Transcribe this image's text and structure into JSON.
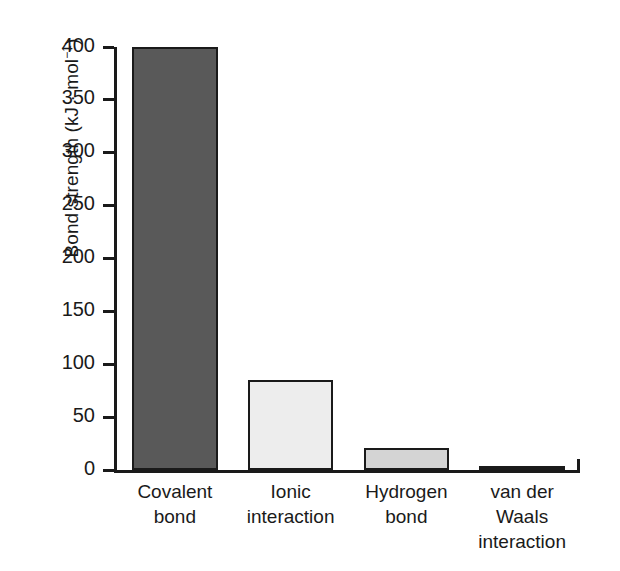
{
  "chart_data": {
    "type": "bar",
    "title": "",
    "xlabel": "",
    "ylabel": "Bond strength (kJ · mol⁻¹)",
    "ylabel_text": "Bond strength (kJ · mol",
    "ylabel_sup": "−1",
    "ylabel_tail": ")",
    "categories": [
      "Covalent bond",
      "Ionic interaction",
      "Hydrogen bond",
      "van der Waals interaction"
    ],
    "category_lines": [
      "Covalent\nbond",
      "Ionic\ninteraction",
      "Hydrogen\nbond",
      "van der\nWaals\ninteraction"
    ],
    "values": [
      400,
      85,
      21,
      4
    ],
    "ylim": [
      0,
      400
    ],
    "yticks": [
      0,
      50,
      100,
      150,
      200,
      250,
      300,
      350,
      400
    ],
    "ytick_labels": [
      "0",
      "50",
      "100",
      "150",
      "200",
      "250",
      "300",
      "350",
      "400"
    ],
    "grid": false,
    "legend": false,
    "bar_colors": [
      "#595959",
      "#ededed",
      "#d4d4d4",
      "#2b2b2b"
    ],
    "bar_edge_color": "#1a1a1a",
    "background": "#ffffff"
  }
}
